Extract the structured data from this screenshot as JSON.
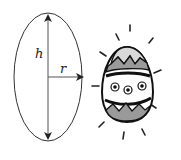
{
  "diagram": {
    "ellipse": {
      "center_x": 48,
      "center_y": 77,
      "rx": 34,
      "ry": 64,
      "stroke": "#333333"
    },
    "labels": {
      "height": "h",
      "radius": "r"
    },
    "egg": {
      "description": "decorated easter egg clip art with radiating lines",
      "stroke": "#111111",
      "shade": "#9a9a9a",
      "top_fill": "#d9d9d9"
    }
  }
}
